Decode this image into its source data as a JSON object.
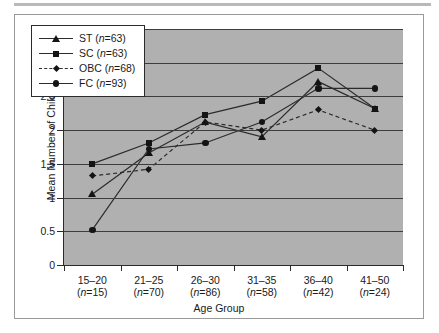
{
  "chart_data": {
    "type": "line",
    "title": "",
    "xlabel": "Age Group",
    "ylabel": "Mean Number of Children",
    "ylim": [
      0,
      3.5
    ],
    "ytick_labels": [
      "0",
      "0.5",
      "1",
      "1.5",
      "2",
      "2.5",
      "3",
      "3.5"
    ],
    "ytick_values": [
      0,
      0.5,
      1,
      1.5,
      2,
      2.5,
      3,
      3.5
    ],
    "grid": true,
    "legend_position": "upper-left-inside",
    "categories": [
      "15–20",
      "21–25",
      "26–30",
      "31–35",
      "36–40",
      "41–50"
    ],
    "category_counts": [
      "(n=15)",
      "(n=70)",
      "(n=86)",
      "(n=58)",
      "(n=42)",
      "(n=24)"
    ],
    "series": [
      {
        "name": "ST",
        "legend_label": "ST (n=63)",
        "n": 63,
        "marker": "triangle",
        "linestyle": "solid",
        "values": [
          1.05,
          1.66,
          2.12,
          1.9,
          2.72,
          2.32
        ]
      },
      {
        "name": "SC",
        "legend_label": "SC (n=63)",
        "n": 63,
        "marker": "square",
        "linestyle": "solid",
        "values": [
          1.5,
          1.81,
          2.23,
          2.43,
          2.92,
          2.32
        ]
      },
      {
        "name": "OBC",
        "legend_label": "OBC (n=68)",
        "n": 68,
        "marker": "diamond",
        "linestyle": "dashed",
        "values": [
          1.32,
          1.42,
          2.12,
          2.0,
          2.3,
          2.0
        ]
      },
      {
        "name": "FC",
        "legend_label": "FC (n=93)",
        "n": 93,
        "marker": "circle",
        "linestyle": "solid",
        "values": [
          0.52,
          1.72,
          1.81,
          2.12,
          2.62,
          2.62
        ]
      }
    ]
  },
  "colors": {
    "plot_background": "#b0b0b0",
    "figure_background": "#ffffff",
    "line": "#2b2b2b",
    "marker": "#141414",
    "gridline": "#3d3d3d",
    "frame": "#9a9a9a"
  }
}
